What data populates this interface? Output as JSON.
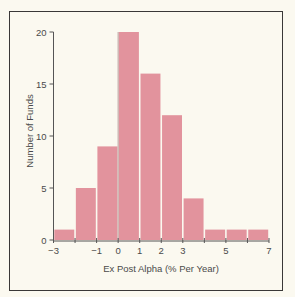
{
  "chart_data": {
    "type": "bar",
    "title": "",
    "xlabel": "Ex Post Alpha (% Per Year)",
    "ylabel": "Number of Funds",
    "bins": [
      {
        "from": -3,
        "to": -2,
        "count": 1
      },
      {
        "from": -2,
        "to": -1,
        "count": 5
      },
      {
        "from": -1,
        "to": 0,
        "count": 9
      },
      {
        "from": 0,
        "to": 1,
        "count": 20
      },
      {
        "from": 1,
        "to": 2,
        "count": 16
      },
      {
        "from": 2,
        "to": 3,
        "count": 12
      },
      {
        "from": 3,
        "to": 4,
        "count": 4
      },
      {
        "from": 4,
        "to": 5,
        "count": 1
      },
      {
        "from": 5,
        "to": 6,
        "count": 1
      },
      {
        "from": 6,
        "to": 7,
        "count": 1
      }
    ],
    "categories": [
      "-3 to -2",
      "-2 to -1",
      "-1 to 0",
      "0 to 1",
      "1 to 2",
      "2 to 3",
      "3 to 4",
      "4 to 5",
      "5 to 6",
      "6 to 7"
    ],
    "values": [
      1,
      5,
      9,
      20,
      16,
      12,
      4,
      1,
      1,
      1
    ],
    "x_ticks": [
      -3,
      -1,
      0,
      1,
      2,
      3,
      5,
      7
    ],
    "x_tick_labels": [
      "−3",
      "−1",
      "0",
      "1",
      "2",
      "3",
      "5",
      "7"
    ],
    "y_ticks": [
      0,
      5,
      10,
      15,
      20
    ],
    "y_tick_labels": [
      "0",
      "5",
      "10",
      "15",
      "20"
    ],
    "xlim": [
      -3,
      7
    ],
    "ylim": [
      0,
      20
    ],
    "grid": false,
    "legend": null,
    "bar_color": "#e2939d"
  }
}
